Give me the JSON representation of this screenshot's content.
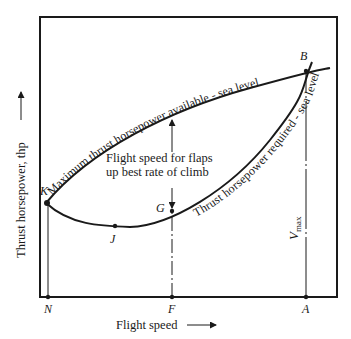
{
  "diagram": {
    "title": "",
    "x_axis_label": "Flight speed",
    "y_axis_label": "Thrust horsepower, thp",
    "curves": {
      "available": "Maximum thrust horsepower available - sea level",
      "required": "Thrust horsepower required - sea level"
    },
    "annotation_line1": "Flight speed for flaps",
    "annotation_line2": "up best rate of climb",
    "vmax_label": "V",
    "vmax_subscript": "max",
    "points": {
      "K": "K",
      "J": "J",
      "G": "G",
      "B": "B",
      "N": "N",
      "F": "F",
      "A": "A"
    },
    "colors": {
      "ink": "#1a1a1a",
      "background": "#ffffff"
    }
  }
}
